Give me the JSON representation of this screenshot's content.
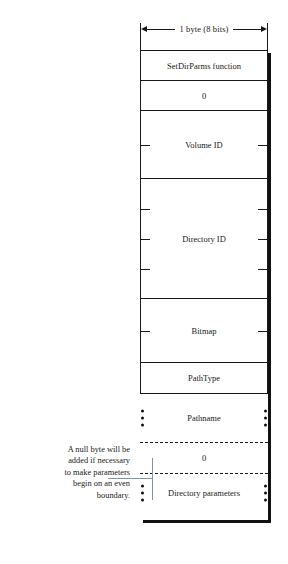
{
  "diagram": {
    "dimension": {
      "label": "1 byte (8 bits)",
      "bits": 8,
      "bytes": 1
    },
    "annotation": {
      "text": "A null byte will be added if necessary to make parameters begin on an even boundary.",
      "line1": "A null byte will be",
      "line2": "added if necessary",
      "line3": "to make parameters",
      "line4": "begin on an even",
      "line5": "boundary."
    },
    "fields": [
      {
        "label": "SetDirParms function",
        "bytes": 1,
        "variable": false,
        "style": "solid"
      },
      {
        "label": "0",
        "bytes": 1,
        "variable": false,
        "style": "solid"
      },
      {
        "label": "Volume ID",
        "bytes": 2,
        "variable": false,
        "style": "solid"
      },
      {
        "label": "Directory ID",
        "bytes": 4,
        "variable": false,
        "style": "solid"
      },
      {
        "label": "Bitmap",
        "bytes": 2,
        "variable": false,
        "style": "solid"
      },
      {
        "label": "PathType",
        "bytes": 1,
        "variable": false,
        "style": "solid"
      },
      {
        "label": "Pathname",
        "bytes": 0,
        "variable": true,
        "style": "dotted-sides"
      },
      {
        "label": "0",
        "bytes": 1,
        "variable": false,
        "style": "dashed"
      },
      {
        "label": "Directory parameters",
        "bytes": 0,
        "variable": true,
        "style": "dotted-sides"
      }
    ],
    "colors": {
      "ink": "#1a1a1a",
      "shadow": "#111111",
      "leader": "#7d93a8",
      "background": "#ffffff"
    }
  }
}
